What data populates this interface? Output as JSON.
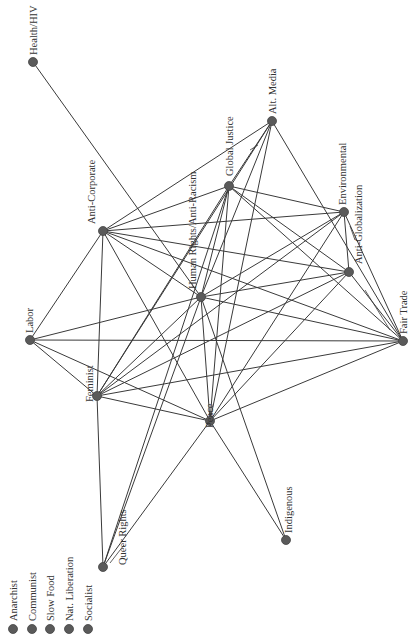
{
  "diagram": {
    "type": "network-graph",
    "orientation": "rotated-90",
    "colors": {
      "node": "#5a5a5a",
      "edge": "#3a3a3a",
      "text": "#333333",
      "background": "#ffffff"
    },
    "nodes": [
      {
        "id": "health",
        "label": "Health/HIV",
        "x": 33,
        "y": 62,
        "lx": 37,
        "ly": 55
      },
      {
        "id": "altmedia",
        "label": "Alt. Media",
        "x": 272,
        "y": 121,
        "lx": 276,
        "ly": 114
      },
      {
        "id": "globaljustice",
        "label": "Global Justice",
        "x": 229,
        "y": 186,
        "lx": 233,
        "ly": 176
      },
      {
        "id": "anticorp",
        "label": "Anti-Corporate",
        "x": 103,
        "y": 231,
        "lx": 95,
        "ly": 224
      },
      {
        "id": "environmental",
        "label": "Environmental",
        "x": 344,
        "y": 212,
        "lx": 346,
        "ly": 205
      },
      {
        "id": "humanrights",
        "label": "Human Rights/Anti-Racism",
        "x": 201,
        "y": 297,
        "lx": 196,
        "ly": 289
      },
      {
        "id": "antiglob",
        "label": "Anti-Globalization",
        "x": 349,
        "y": 272,
        "lx": 362,
        "ly": 264
      },
      {
        "id": "labor",
        "label": "Labor",
        "x": 30,
        "y": 340,
        "lx": 33,
        "ly": 333
      },
      {
        "id": "fairtrade",
        "label": "Fair Trade",
        "x": 403,
        "y": 341,
        "lx": 407,
        "ly": 334
      },
      {
        "id": "feminist",
        "label": "Feminist",
        "x": 97,
        "y": 396,
        "lx": 93,
        "ly": 402
      },
      {
        "id": "peace",
        "label": "Peace",
        "x": 210,
        "y": 421,
        "lx": 213,
        "ly": 428
      },
      {
        "id": "indigenous",
        "label": "Indigenous",
        "x": 286,
        "y": 540,
        "lx": 292,
        "ly": 533
      },
      {
        "id": "queer",
        "label": "Queer Rights",
        "x": 103,
        "y": 567,
        "lx": 126,
        "ly": 565
      }
    ],
    "edges": [
      [
        "health",
        "humanrights"
      ],
      [
        "altmedia",
        "anticorp"
      ],
      [
        "altmedia",
        "globaljustice"
      ],
      [
        "altmedia",
        "humanrights"
      ],
      [
        "altmedia",
        "feminist"
      ],
      [
        "altmedia",
        "peace"
      ],
      [
        "altmedia",
        "fairtrade"
      ],
      [
        "globaljustice",
        "anticorp"
      ],
      [
        "globaljustice",
        "environmental"
      ],
      [
        "globaljustice",
        "antiglob"
      ],
      [
        "globaljustice",
        "fairtrade"
      ],
      [
        "globaljustice",
        "humanrights"
      ],
      [
        "globaljustice",
        "feminist"
      ],
      [
        "globaljustice",
        "peace"
      ],
      [
        "globaljustice",
        "queer"
      ],
      [
        "anticorp",
        "environmental"
      ],
      [
        "anticorp",
        "antiglob"
      ],
      [
        "anticorp",
        "humanrights"
      ],
      [
        "anticorp",
        "labor"
      ],
      [
        "anticorp",
        "feminist"
      ],
      [
        "anticorp",
        "peace"
      ],
      [
        "anticorp",
        "fairtrade"
      ],
      [
        "environmental",
        "antiglob"
      ],
      [
        "environmental",
        "fairtrade"
      ],
      [
        "environmental",
        "humanrights"
      ],
      [
        "environmental",
        "feminist"
      ],
      [
        "environmental",
        "peace"
      ],
      [
        "antiglob",
        "humanrights"
      ],
      [
        "antiglob",
        "fairtrade"
      ],
      [
        "antiglob",
        "feminist"
      ],
      [
        "antiglob",
        "peace"
      ],
      [
        "humanrights",
        "labor"
      ],
      [
        "humanrights",
        "feminist"
      ],
      [
        "humanrights",
        "peace"
      ],
      [
        "humanrights",
        "fairtrade"
      ],
      [
        "humanrights",
        "indigenous"
      ],
      [
        "humanrights",
        "queer"
      ],
      [
        "labor",
        "feminist"
      ],
      [
        "labor",
        "peace"
      ],
      [
        "labor",
        "fairtrade"
      ],
      [
        "feminist",
        "peace"
      ],
      [
        "feminist",
        "fairtrade"
      ],
      [
        "feminist",
        "queer"
      ],
      [
        "peace",
        "fairtrade"
      ],
      [
        "peace",
        "indigenous"
      ],
      [
        "peace",
        "queer"
      ]
    ],
    "legend": {
      "items": [
        {
          "label": "Anarchist",
          "x": 13,
          "y": 629
        },
        {
          "label": "Communist",
          "x": 32,
          "y": 629
        },
        {
          "label": "Slow Food",
          "x": 50,
          "y": 629
        },
        {
          "label": "Nat. Liberation",
          "x": 69,
          "y": 629
        },
        {
          "label": "Socialist",
          "x": 88,
          "y": 629
        }
      ]
    }
  }
}
